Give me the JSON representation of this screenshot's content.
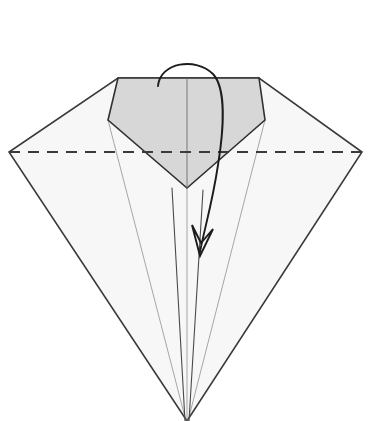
{
  "figure": {
    "title": "Origami fold step diagram",
    "canvas": {
      "width": 368,
      "height": 421
    },
    "background_color": "#ffffff"
  },
  "style": {
    "paper_fill": "#f7f7f7",
    "paper_stroke": "#3a3a3a",
    "flap_fill": "#d7d7d7",
    "flap_stroke": "#303030",
    "crease_thin_stroke": "#6e6e6e",
    "crease_mid_stroke": "#4a4a4a",
    "dashed_stroke": "#3a3a3a",
    "arrow_stroke": "#1c1c1c",
    "outer_stroke_width": 1.6,
    "flap_stroke_width": 1.6,
    "thin_stroke_width": 0.6,
    "mid_stroke_width": 1.1,
    "dash_stroke_width": 2.0,
    "dash_pattern": "11 8",
    "arrow_stroke_width": 1.9
  },
  "geometry": {
    "outer_body": {
      "label": "outer-kite-outline",
      "points": "118,78 259,78 362,152 187,421 9,152",
      "vertices": [
        {
          "name": "top-left-corner",
          "x": 118,
          "y": 78
        },
        {
          "name": "top-right-corner",
          "x": 259,
          "y": 78
        },
        {
          "name": "right-vertex",
          "x": 362,
          "y": 152
        },
        {
          "name": "bottom-apex",
          "x": 187,
          "y": 421
        },
        {
          "name": "left-vertex",
          "x": 9,
          "y": 152
        }
      ]
    },
    "shaded_flap": {
      "label": "shaded-pentagon-flap",
      "points": "118,78 259,78 265,120 187,188 108,120",
      "vertices": [
        {
          "name": "flap-top-left",
          "x": 118,
          "y": 78
        },
        {
          "name": "flap-top-right",
          "x": 259,
          "y": 78
        },
        {
          "name": "flap-right-shoulder",
          "x": 265,
          "y": 120
        },
        {
          "name": "flap-bottom-point",
          "x": 187,
          "y": 188
        },
        {
          "name": "flap-left-shoulder",
          "x": 108,
          "y": 120
        }
      ]
    },
    "fold_line": {
      "label": "horizontal-valley-fold",
      "x1": 9,
      "y1": 152,
      "x2": 362,
      "y2": 152,
      "type": "dashed"
    },
    "center_line": {
      "label": "vertical-center-crease",
      "x1": 187,
      "y1": 78,
      "x2": 187,
      "y2": 188
    },
    "crease_lines": [
      {
        "name": "crease-left-thin",
        "x1": 108,
        "y1": 120,
        "x2": 186,
        "y2": 421,
        "weight": "thin"
      },
      {
        "name": "crease-right-thin",
        "x1": 265,
        "y1": 120,
        "x2": 188,
        "y2": 421,
        "weight": "thin"
      },
      {
        "name": "crease-center-thin",
        "x1": 187,
        "y1": 188,
        "x2": 187,
        "y2": 421,
        "weight": "thin"
      },
      {
        "name": "crease-left-mid",
        "x1": 172,
        "y1": 188,
        "x2": 185,
        "y2": 421,
        "weight": "mid"
      },
      {
        "name": "crease-right-mid",
        "x1": 203,
        "y1": 190,
        "x2": 189,
        "y2": 421,
        "weight": "mid"
      }
    ],
    "arrow": {
      "label": "fold-direction-arrow",
      "shaft_path": "M 158,86 C 160,62 196,57 213,74 C 226,88 224,128 218,165 C 212,205 204,230 200,252",
      "head_points": "200,256 192,225 201,243 213,229",
      "tip": {
        "x": 200,
        "y": 256
      },
      "direction": "downward-fold"
    }
  },
  "labels": {
    "step_number": "",
    "caption": ""
  }
}
